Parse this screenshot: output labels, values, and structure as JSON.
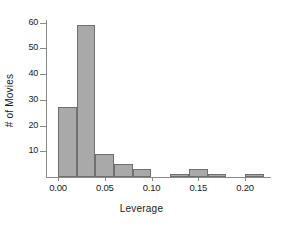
{
  "chart_data": {
    "type": "bar",
    "title": "",
    "xlabel": "Leverage",
    "ylabel": "# of Movies",
    "grid": false,
    "legend": "none",
    "bin_width": 0.02,
    "xlim": [
      0.0,
      0.22
    ],
    "ylim": [
      0,
      62
    ],
    "xticks": [
      "0.00",
      "0.05",
      "0.10",
      "0.15",
      "0.20"
    ],
    "xtick_values": [
      0.0,
      0.05,
      0.1,
      0.15,
      0.2
    ],
    "yticks": [
      "10",
      "20",
      "30",
      "40",
      "50",
      "60"
    ],
    "ytick_values": [
      10,
      20,
      30,
      40,
      50,
      60
    ],
    "categories": [
      "0.00-0.02",
      "0.02-0.04",
      "0.04-0.06",
      "0.06-0.08",
      "0.08-0.10",
      "0.10-0.12",
      "0.12-0.14",
      "0.14-0.16",
      "0.16-0.18",
      "0.18-0.20",
      "0.20-0.22"
    ],
    "bin_edges": [
      0.0,
      0.02,
      0.04,
      0.06,
      0.08,
      0.1,
      0.12,
      0.14,
      0.16,
      0.18,
      0.2,
      0.22
    ],
    "values": [
      27,
      59,
      9,
      5,
      3,
      0,
      1,
      3,
      1,
      0,
      1
    ],
    "colors": {
      "bar_fill": "#a9a9a9",
      "bar_edge": "#6f6f6f",
      "axis": "#8a8a8a",
      "text": "#1a1a1a",
      "background": "#ffffff"
    }
  }
}
